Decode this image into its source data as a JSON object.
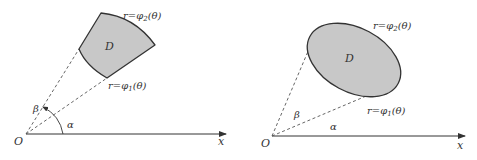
{
  "figure": {
    "left": {
      "origin_label": "O",
      "axis_label": "x",
      "region_label": "D",
      "outer_curve_label": "r=φ",
      "outer_curve_sub": "2",
      "outer_curve_arg": "(θ)",
      "inner_curve_label": "r=φ",
      "inner_curve_sub": "1",
      "inner_curve_arg": "(θ)",
      "angle_alpha": "α",
      "angle_beta": "β"
    },
    "right": {
      "origin_label": "O",
      "axis_label": "x",
      "region_label": "D",
      "outer_curve_label": "r=φ",
      "outer_curve_sub": "2",
      "outer_curve_arg": "(θ)",
      "inner_curve_label": "r=φ",
      "inner_curve_sub": "1",
      "inner_curve_arg": "(θ)",
      "angle_alpha": "α",
      "angle_beta": "β"
    },
    "colors": {
      "region_fill": "#c8c8c8",
      "outline": "#333333",
      "dashed": "#555555",
      "axis": "#333333"
    }
  }
}
